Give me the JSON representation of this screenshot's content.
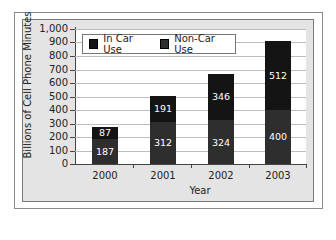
{
  "chart_data": {
    "type": "bar",
    "stacked": true,
    "title": "",
    "xlabel": "Year",
    "ylabel": "Billions of Cell Phone Minutes",
    "categories": [
      "2000",
      "2001",
      "2002",
      "2003"
    ],
    "series": [
      {
        "name": "Non-Car Use",
        "values": [
          187,
          312,
          324,
          400
        ],
        "color": "#2e2e2e"
      },
      {
        "name": "In Car Use",
        "values": [
          87,
          191,
          346,
          512
        ],
        "color": "#141414"
      }
    ],
    "totals": [
      274,
      503,
      670,
      912
    ],
    "ylim": [
      0,
      1000
    ],
    "yticks": [
      "0",
      "100",
      "200",
      "300",
      "400",
      "500",
      "600",
      "700",
      "800",
      "900",
      "1,000"
    ],
    "grid": true,
    "legend": {
      "position": "top-left inside",
      "entries": [
        "In Car Use",
        "Non-Car Use"
      ]
    }
  },
  "legend": {
    "in_car": "In Car Use",
    "non_car": "Non-Car Use"
  },
  "axes": {
    "x_title": "Year",
    "y_title": "Billions of Cell Phone Minutes"
  }
}
